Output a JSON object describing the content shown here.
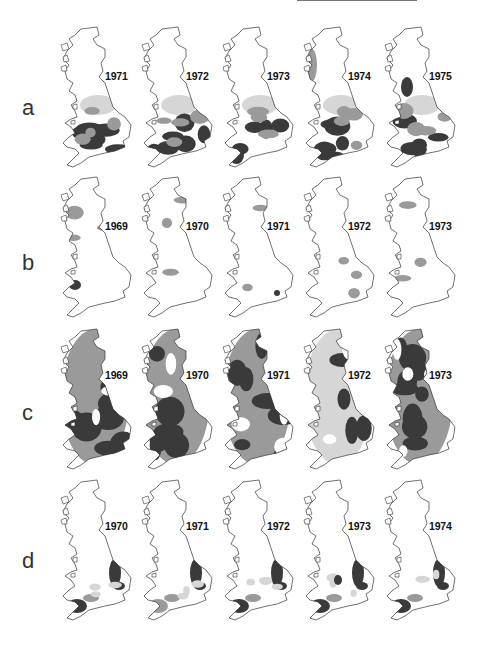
{
  "figure": {
    "top_rule": true,
    "rows": [
      {
        "letter": "a",
        "panels": [
          {
            "year": "1971",
            "pattern": "south-heavy"
          },
          {
            "year": "1972",
            "pattern": "south-heavy"
          },
          {
            "year": "1973",
            "pattern": "south-heavy"
          },
          {
            "year": "1974",
            "pattern": "south-heavy-west-coast"
          },
          {
            "year": "1975",
            "pattern": "patchy-midlands"
          }
        ]
      },
      {
        "letter": "b",
        "panels": [
          {
            "year": "1969",
            "pattern": "sparse"
          },
          {
            "year": "1970",
            "pattern": "sparse"
          },
          {
            "year": "1971",
            "pattern": "sparse"
          },
          {
            "year": "1972",
            "pattern": "sparse"
          },
          {
            "year": "1973",
            "pattern": "sparse"
          }
        ]
      },
      {
        "letter": "c",
        "panels": [
          {
            "year": "1969",
            "pattern": "dense"
          },
          {
            "year": "1970",
            "pattern": "dense"
          },
          {
            "year": "1971",
            "pattern": "dense"
          },
          {
            "year": "1972",
            "pattern": "medium"
          },
          {
            "year": "1973",
            "pattern": "very-dense"
          }
        ]
      },
      {
        "letter": "d",
        "panels": [
          {
            "year": "1970",
            "pattern": "east-and-southwest"
          },
          {
            "year": "1971",
            "pattern": "east-and-southwest"
          },
          {
            "year": "1972",
            "pattern": "east-and-southwest"
          },
          {
            "year": "1973",
            "pattern": "east-and-southwest"
          },
          {
            "year": "1974",
            "pattern": "east-and-southwest"
          }
        ]
      }
    ],
    "shade_colors": {
      "outline": "#333333",
      "light": "#d6d6d6",
      "medium": "#9a9a9a",
      "dark": "#3a3a3a",
      "background": "#ffffff"
    }
  }
}
